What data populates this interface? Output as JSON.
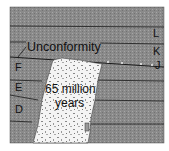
{
  "diagram": {
    "labels": {
      "unconformity": "Unconformity",
      "layers": [
        "L",
        "K",
        "J",
        "F",
        "E",
        "D"
      ],
      "intrusion_line1": "65 million",
      "intrusion_line2": "years"
    },
    "colors": {
      "rock": "#8a8a8a",
      "rock_dot": "#a8a8a8",
      "line": "#1a1a1a",
      "intrusion": "#f4f4f4",
      "intrusion_speck": "#777777",
      "background": "#ffffff"
    }
  }
}
